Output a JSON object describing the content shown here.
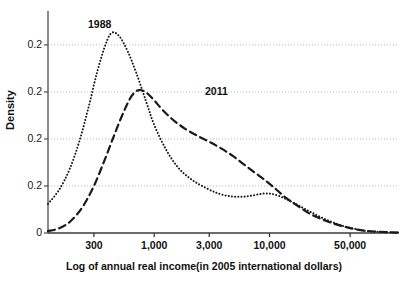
{
  "chart_data": {
    "type": "line",
    "title": "",
    "xlabel": "Log of annual real income(in 2005 international dollars)",
    "ylabel": "Density",
    "x_scale": "log",
    "x_tick_labels": [
      "300",
      "1,000",
      "3,000",
      "10,000",
      "50,000"
    ],
    "x_tick_values": [
      300,
      1000,
      3000,
      10000,
      50000
    ],
    "y_tick_labels": [
      "0",
      "0.2",
      "0.2",
      "0.2",
      "0.2"
    ],
    "y_tick_values": [
      0,
      0.05,
      0.1,
      0.15,
      0.2
    ],
    "ylim": [
      0,
      0.235
    ],
    "grid": "horizontal-dotted",
    "legend_position": "inline-annotations",
    "annotations": [
      {
        "text": "1988",
        "x_px": 88,
        "y_px": 18
      },
      {
        "text": "2011",
        "x_px": 205,
        "y_px": 85
      }
    ],
    "series": [
      {
        "name": "1988",
        "style": "dotted",
        "color": "#1a1a1a",
        "label": "1988",
        "peak_income": 400,
        "peak_density": 0.213,
        "points": [
          {
            "income": 120,
            "density": 0.031
          },
          {
            "income": 150,
            "density": 0.046
          },
          {
            "income": 185,
            "density": 0.068
          },
          {
            "income": 225,
            "density": 0.098
          },
          {
            "income": 270,
            "density": 0.134
          },
          {
            "income": 320,
            "density": 0.171
          },
          {
            "income": 380,
            "density": 0.201
          },
          {
            "income": 430,
            "density": 0.213
          },
          {
            "income": 500,
            "density": 0.209
          },
          {
            "income": 590,
            "density": 0.193
          },
          {
            "income": 700,
            "density": 0.17
          },
          {
            "income": 850,
            "density": 0.14
          },
          {
            "income": 1000,
            "density": 0.115
          },
          {
            "income": 1250,
            "density": 0.09
          },
          {
            "income": 1600,
            "density": 0.07
          },
          {
            "income": 2100,
            "density": 0.057
          },
          {
            "income": 2800,
            "density": 0.048
          },
          {
            "income": 3600,
            "density": 0.042
          },
          {
            "income": 4600,
            "density": 0.039
          },
          {
            "income": 5800,
            "density": 0.0385
          },
          {
            "income": 7200,
            "density": 0.04
          },
          {
            "income": 9000,
            "density": 0.042
          },
          {
            "income": 11000,
            "density": 0.041
          },
          {
            "income": 14000,
            "density": 0.036
          },
          {
            "income": 18000,
            "density": 0.029
          },
          {
            "income": 23000,
            "density": 0.022
          },
          {
            "income": 30000,
            "density": 0.015
          },
          {
            "income": 40000,
            "density": 0.009
          },
          {
            "income": 52000,
            "density": 0.005
          },
          {
            "income": 70000,
            "density": 0.002
          },
          {
            "income": 95000,
            "density": 0.001
          },
          {
            "income": 130000,
            "density": 0.0005
          }
        ]
      },
      {
        "name": "2011",
        "style": "dashed",
        "color": "#1a1a1a",
        "label": "2011",
        "peak_income": 700,
        "peak_density": 0.152,
        "points": [
          {
            "income": 120,
            "density": 0.002
          },
          {
            "income": 150,
            "density": 0.005
          },
          {
            "income": 190,
            "density": 0.013
          },
          {
            "income": 240,
            "density": 0.028
          },
          {
            "income": 300,
            "density": 0.05
          },
          {
            "income": 370,
            "density": 0.077
          },
          {
            "income": 450,
            "density": 0.104
          },
          {
            "income": 540,
            "density": 0.128
          },
          {
            "income": 640,
            "density": 0.146
          },
          {
            "income": 740,
            "density": 0.152
          },
          {
            "income": 860,
            "density": 0.149
          },
          {
            "income": 1000,
            "density": 0.141
          },
          {
            "income": 1200,
            "density": 0.13
          },
          {
            "income": 1500,
            "density": 0.119
          },
          {
            "income": 1900,
            "density": 0.11
          },
          {
            "income": 2400,
            "density": 0.103
          },
          {
            "income": 3000,
            "density": 0.097
          },
          {
            "income": 3800,
            "density": 0.09
          },
          {
            "income": 4800,
            "density": 0.082
          },
          {
            "income": 6000,
            "density": 0.073
          },
          {
            "income": 7500,
            "density": 0.064
          },
          {
            "income": 9400,
            "density": 0.055
          },
          {
            "income": 11500,
            "density": 0.046
          },
          {
            "income": 14000,
            "density": 0.037
          },
          {
            "income": 17500,
            "density": 0.029
          },
          {
            "income": 22000,
            "density": 0.021
          },
          {
            "income": 28000,
            "density": 0.015
          },
          {
            "income": 36000,
            "density": 0.01
          },
          {
            "income": 47000,
            "density": 0.006
          },
          {
            "income": 62000,
            "density": 0.003
          },
          {
            "income": 85000,
            "density": 0.0015
          },
          {
            "income": 130000,
            "density": 0.0005
          }
        ]
      }
    ]
  }
}
